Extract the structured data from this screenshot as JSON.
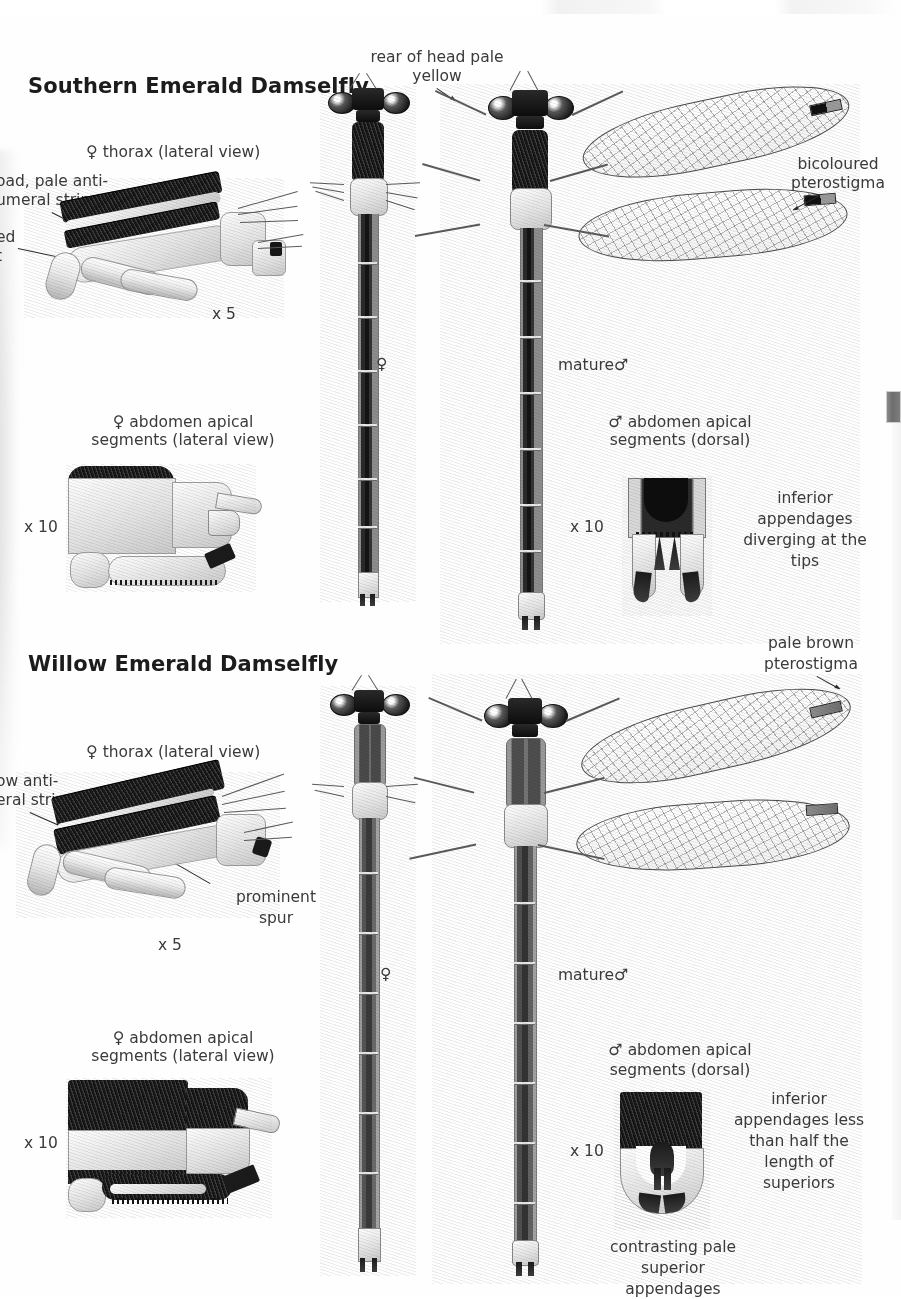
{
  "page": {
    "width": 901,
    "height": 1295,
    "background": "#fefefe",
    "ink": "#2e2e2e"
  },
  "sections": [
    {
      "id": "southern",
      "title": "Southern Emerald Damselfly",
      "labels": {
        "thorax_caption_line1": "thorax (lateral view)",
        "thorax_caption_symbol": "♀",
        "thorax_scale": "x 5",
        "antehumeral_line1": "oad, pale anti-",
        "antehumeral_line2": "umeral stripe",
        "antehumeral_full": "broad, pale antehumeral stripe",
        "spur_line1": "ed",
        "spur_line2": "t",
        "rear_of_head_line1": "rear of head pale",
        "rear_of_head_line2": "yellow",
        "pterostigma_line1": "bicoloured",
        "pterostigma_line2": "pterostigma",
        "female_symbol": "♀",
        "male_caption": "mature",
        "male_symbol": "♂",
        "female_apical_symbol": "♀",
        "female_apical_line1": "abdomen apical",
        "female_apical_line2": "segments (lateral view)",
        "female_apical_scale": "x 10",
        "male_apical_symbol": "♂",
        "male_apical_line1": "abdomen apical",
        "male_apical_line2": "segments (dorsal)",
        "male_apical_scale": "x 10",
        "appendage_note_line1": "inferior",
        "appendage_note_line2": "appendages",
        "appendage_note_line3": "diverging at the",
        "appendage_note_line4": "tips"
      }
    },
    {
      "id": "willow",
      "title": "Willow Emerald Damselfly",
      "labels": {
        "thorax_caption_line1": "thorax (lateral view)",
        "thorax_caption_symbol": "♀",
        "thorax_scale": "x 5",
        "antehumeral_line1": "ow anti-",
        "antehumeral_line2": "eral stripe",
        "antehumeral_full": "narrow antehumeral stripe",
        "spur_line1": "prominent",
        "spur_line2": "spur",
        "pterostigma_line1": "pale brown",
        "pterostigma_line2": "pterostigma",
        "female_symbol": "♀",
        "male_caption": "mature",
        "male_symbol": "♂",
        "female_apical_symbol": "♀",
        "female_apical_line1": "abdomen apical",
        "female_apical_line2": "segments (lateral view)",
        "female_apical_scale": "x 10",
        "male_apical_symbol": "♂",
        "male_apical_line1": "abdomen apical",
        "male_apical_line2": "segments (dorsal)",
        "male_apical_scale": "x 10",
        "appendage_note_line1": "inferior",
        "appendage_note_line2": "appendages less",
        "appendage_note_line3": "than half the",
        "appendage_note_line4": "length of",
        "appendage_note_line5": "superiors",
        "superior_note_line1": "contrasting pale",
        "superior_note_line2": "superior",
        "superior_note_line3": "appendages"
      }
    }
  ],
  "figures": {
    "southern_thorax": "female-thorax-lateral-illustration",
    "southern_female_dorsal": "female-damselfly-dorsal-illustration",
    "southern_male_dorsal": "mature-male-damselfly-dorsal-illustration",
    "southern_female_apical": "female-abdomen-apical-lateral-illustration",
    "southern_male_apical": "male-abdomen-apical-dorsal-illustration",
    "willow_thorax": "female-thorax-lateral-illustration",
    "willow_female_dorsal": "female-damselfly-dorsal-illustration",
    "willow_male_dorsal": "mature-male-damselfly-dorsal-illustration",
    "willow_female_apical": "female-abdomen-apical-lateral-illustration",
    "willow_male_apical": "male-abdomen-apical-dorsal-illustration"
  }
}
